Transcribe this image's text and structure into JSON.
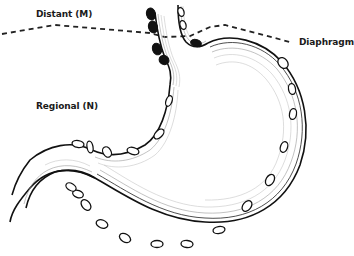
{
  "figure": {
    "labels": {
      "distant": "Distant (M)",
      "regional": "Regional (N)",
      "diaphragm": "Diaphragm"
    },
    "legend": {
      "distant_nodes": {
        "style": "filled black ovals",
        "color": "#111111"
      },
      "regional_nodes": {
        "style": "open ovals",
        "color": "#ffffff"
      }
    },
    "diaphragm_line": {
      "style": "dashed"
    }
  }
}
